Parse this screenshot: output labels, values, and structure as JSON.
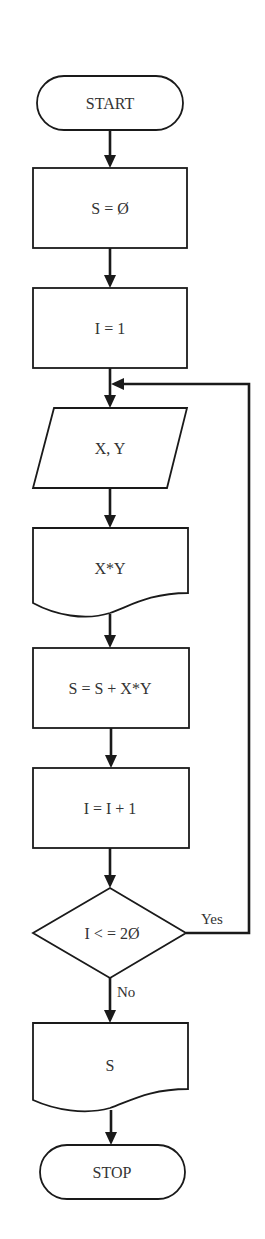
{
  "diagram": {
    "type": "flowchart",
    "nodes": [
      {
        "id": "start",
        "shape": "terminator",
        "label": "START"
      },
      {
        "id": "init_s",
        "shape": "process",
        "label": "S = Ø"
      },
      {
        "id": "init_i",
        "shape": "process",
        "label": "I = 1"
      },
      {
        "id": "input_xy",
        "shape": "input-output",
        "label": "X, Y"
      },
      {
        "id": "doc_xy",
        "shape": "document",
        "label": "X*Y"
      },
      {
        "id": "accumulate",
        "shape": "process",
        "label": "S = S + X*Y"
      },
      {
        "id": "increment",
        "shape": "process",
        "label": "I = I + 1"
      },
      {
        "id": "decision",
        "shape": "decision",
        "label": "I < = 2Ø"
      },
      {
        "id": "output_s",
        "shape": "document",
        "label": "S"
      },
      {
        "id": "stop",
        "shape": "terminator",
        "label": "STOP"
      }
    ],
    "edges": [
      {
        "from": "start",
        "to": "init_s",
        "label": ""
      },
      {
        "from": "init_s",
        "to": "init_i",
        "label": ""
      },
      {
        "from": "init_i",
        "to": "input_xy",
        "label": ""
      },
      {
        "from": "input_xy",
        "to": "doc_xy",
        "label": ""
      },
      {
        "from": "doc_xy",
        "to": "accumulate",
        "label": ""
      },
      {
        "from": "accumulate",
        "to": "increment",
        "label": ""
      },
      {
        "from": "increment",
        "to": "decision",
        "label": ""
      },
      {
        "from": "decision",
        "to": "input_xy",
        "label": "Yes"
      },
      {
        "from": "decision",
        "to": "output_s",
        "label": "No"
      },
      {
        "from": "output_s",
        "to": "stop",
        "label": ""
      }
    ],
    "colors": {
      "stroke": "#1a1a1a",
      "text": "#333333",
      "background": "#ffffff"
    }
  }
}
